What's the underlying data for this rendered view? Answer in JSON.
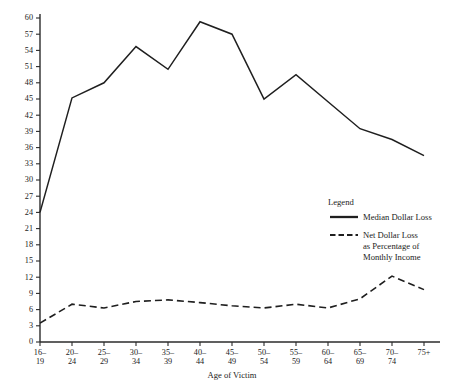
{
  "chart_data": {
    "type": "line",
    "title": "",
    "xlabel": "Age of Victim",
    "ylabel": "",
    "categories": [
      "16–\n19",
      "20–\n24",
      "25–\n29",
      "30–\n34",
      "35–\n39",
      "40–\n44",
      "45–\n49",
      "50–\n54",
      "55–\n59",
      "60–\n64",
      "65–\n69",
      "70–\n74",
      "75+"
    ],
    "category_lines": [
      [
        "16–",
        "19"
      ],
      [
        "20–",
        "24"
      ],
      [
        "25–",
        "29"
      ],
      [
        "30–",
        "34"
      ],
      [
        "35–",
        "39"
      ],
      [
        "40–",
        "44"
      ],
      [
        "45–",
        "49"
      ],
      [
        "50–",
        "54"
      ],
      [
        "55–",
        "59"
      ],
      [
        "60–",
        "64"
      ],
      [
        "65–",
        "69"
      ],
      [
        "70–",
        "74"
      ],
      [
        "75+",
        ""
      ]
    ],
    "series": [
      {
        "name": "Median Dollar Loss",
        "style": "solid",
        "values": [
          24,
          45.2,
          48,
          54.7,
          50.5,
          59.3,
          57,
          45,
          49.5,
          44.5,
          39.5,
          37.5,
          34.5
        ]
      },
      {
        "name": "Net Dollar Loss as Percentage of Monthly Income",
        "style": "dashed",
        "values": [
          3.5,
          7.0,
          6.3,
          7.5,
          7.8,
          7.3,
          6.7,
          6.3,
          7.0,
          6.3,
          8.0,
          12.2,
          9.7
        ]
      }
    ],
    "ylim": [
      0,
      60
    ],
    "ytick_step": 3,
    "yticks": [
      0,
      3,
      6,
      9,
      12,
      15,
      18,
      21,
      24,
      27,
      30,
      33,
      36,
      39,
      42,
      45,
      48,
      51,
      54,
      57,
      60
    ],
    "grid": false,
    "legend_position": "inside-right"
  },
  "legend": {
    "title": "Legend",
    "entries": [
      {
        "label": "Median Dollar Loss",
        "style": "solid",
        "lines": [
          "Median Dollar Loss"
        ]
      },
      {
        "label": "Net Dollar Loss as Percentage of Monthly Income",
        "style": "dashed",
        "lines": [
          "Net Dollar Loss",
          "as Percentage of",
          "Monthly Income"
        ]
      }
    ]
  },
  "colors": {
    "line": "#1f1f1f",
    "axis": "#2b2b2b",
    "background": "#ffffff",
    "text": "#222222"
  }
}
